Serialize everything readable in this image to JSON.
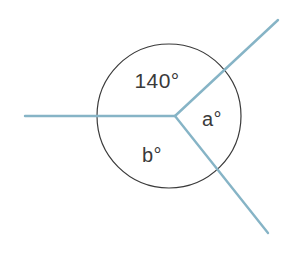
{
  "figure": {
    "background_color": "#ffffff",
    "circle": {
      "center_x": 169,
      "center_y": 116,
      "radius": 72,
      "stroke_color": "#3a3a3a",
      "stroke_width": 1.2,
      "fill": "none"
    },
    "vertex": {
      "x": 175,
      "y": 116
    },
    "ray_color": "#86b4c6",
    "ray_width": 2.4,
    "rays": [
      {
        "name": "ray-left",
        "end_x": 25,
        "end_y": 116,
        "direction_degrees": 180
      },
      {
        "name": "ray-upper-right",
        "end_x": 278,
        "end_y": 20,
        "direction_degrees": 43
      },
      {
        "name": "ray-lower-right",
        "end_x": 268,
        "end_y": 233,
        "direction_degrees": -51.5
      }
    ],
    "labels": [
      {
        "name": "angle-label-140",
        "text": "140°",
        "x": 157,
        "y": 82,
        "size": "large"
      },
      {
        "name": "angle-label-a",
        "text": "a°",
        "x": 212,
        "y": 121,
        "size": "small"
      },
      {
        "name": "angle-label-b",
        "text": "b°",
        "x": 152,
        "y": 157,
        "size": "small"
      }
    ]
  },
  "chart_data": {
    "type": "pie",
    "categories": [
      "140°",
      "a°",
      "b°"
    ],
    "values": [
      140,
      95,
      125
    ],
    "labels": [
      "140°",
      "a°",
      "b°"
    ],
    "known_values": [
      140
    ],
    "unknown_labels": [
      "a",
      "b"
    ],
    "total_degrees": 360,
    "legend": "none",
    "grid": false
  }
}
